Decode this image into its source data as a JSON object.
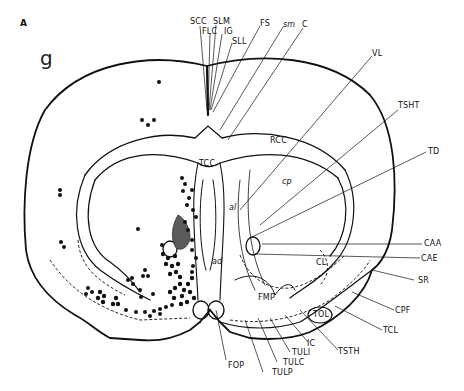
{
  "figure": {
    "panel_label": "A",
    "level_label": "g",
    "ink_color": "#111111",
    "lesion_color": "#5a5a5a"
  },
  "labels": {
    "top": [
      {
        "id": "SCC",
        "text": "SCC"
      },
      {
        "id": "SLM",
        "text": "SLM"
      },
      {
        "id": "FLC",
        "text": "FLC"
      },
      {
        "id": "IG",
        "text": "IG"
      },
      {
        "id": "SLL",
        "text": "SLL"
      },
      {
        "id": "FS",
        "text": "FS"
      },
      {
        "id": "sm",
        "text": "sm"
      },
      {
        "id": "C",
        "text": "C"
      }
    ],
    "right": [
      {
        "id": "VL",
        "text": "VL"
      },
      {
        "id": "TSHT",
        "text": "TSHT"
      },
      {
        "id": "TD",
        "text": "TD"
      },
      {
        "id": "CAA",
        "text": "CAA"
      },
      {
        "id": "CAE",
        "text": "CAE"
      },
      {
        "id": "SR",
        "text": "SR"
      },
      {
        "id": "CPF",
        "text": "CPF"
      },
      {
        "id": "TCL",
        "text": "TCL"
      }
    ],
    "bottom": [
      {
        "id": "FOP",
        "text": "FOP"
      },
      {
        "id": "TULP",
        "text": "TULP"
      },
      {
        "id": "TULC",
        "text": "TULC"
      },
      {
        "id": "TULI",
        "text": "TULI"
      },
      {
        "id": "IC",
        "text": "IC"
      },
      {
        "id": "TSTH",
        "text": "TSTH"
      }
    ],
    "internal": [
      {
        "id": "TCC",
        "text": "TCC"
      },
      {
        "id": "RCC",
        "text": "RCC"
      },
      {
        "id": "cp",
        "text": "cp"
      },
      {
        "id": "al",
        "text": "al"
      },
      {
        "id": "ad",
        "text": "ad"
      },
      {
        "id": "CL",
        "text": "CL"
      },
      {
        "id": "FMP",
        "text": "FMP"
      },
      {
        "id": "TOL",
        "text": "TOL"
      }
    ]
  }
}
